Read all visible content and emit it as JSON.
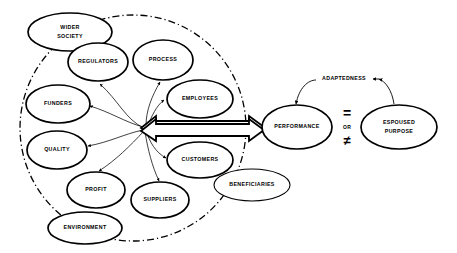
{
  "diagram": {
    "boundary": {
      "name": "organisational-boundary",
      "style": "dash-dot-circle"
    },
    "stakeholders": [
      {
        "id": "wider-society",
        "label": "WIDER\nSOCIETY",
        "line1": "WIDER",
        "line2": "SOCIETY",
        "cx": 70,
        "cy": 32,
        "rx": 42,
        "ry": 19,
        "inside_boundary": "straddles"
      },
      {
        "id": "regulators",
        "label": "REGULATORS",
        "line1": "REGULATORS",
        "line2": "",
        "cx": 98,
        "cy": 62,
        "rx": 30,
        "ry": 19,
        "inside_boundary": "yes"
      },
      {
        "id": "process",
        "label": "PROCESS",
        "line1": "PROCESS",
        "line2": "",
        "cx": 163,
        "cy": 60,
        "rx": 30,
        "ry": 20,
        "inside_boundary": "yes"
      },
      {
        "id": "employees",
        "label": "EMPLOYEES",
        "line1": "EMPLOYEES",
        "line2": "",
        "cx": 200,
        "cy": 99,
        "rx": 33,
        "ry": 19,
        "inside_boundary": "yes"
      },
      {
        "id": "funders",
        "label": "FUNDERS",
        "line1": "FUNDERS",
        "line2": "",
        "cx": 58,
        "cy": 104,
        "rx": 32,
        "ry": 19,
        "inside_boundary": "yes"
      },
      {
        "id": "quality",
        "label": "QUALITY",
        "line1": "QUALITY",
        "line2": "",
        "cx": 57,
        "cy": 150,
        "rx": 30,
        "ry": 19,
        "inside_boundary": "yes"
      },
      {
        "id": "customers",
        "label": "CUSTOMERS",
        "line1": "CUSTOMERS",
        "line2": "",
        "cx": 200,
        "cy": 160,
        "rx": 33,
        "ry": 18,
        "inside_boundary": "yes"
      },
      {
        "id": "profit",
        "label": "PROFIT",
        "line1": "PROFIT",
        "line2": "",
        "cx": 96,
        "cy": 190,
        "rx": 29,
        "ry": 18,
        "inside_boundary": "yes"
      },
      {
        "id": "suppliers",
        "label": "SUPPLIERS",
        "line1": "SUPPLIERS",
        "line2": "",
        "cx": 160,
        "cy": 200,
        "rx": 29,
        "ry": 18,
        "inside_boundary": "yes"
      },
      {
        "id": "environment",
        "label": "ENVIRONMENT",
        "line1": "ENVIRONMENT",
        "line2": "",
        "cx": 85,
        "cy": 228,
        "rx": 37,
        "ry": 16,
        "inside_boundary": "straddles"
      },
      {
        "id": "beneficiaries",
        "label": "BENEFICIARIES",
        "line1": "BENEFICIARIES",
        "line2": "",
        "cx": 252,
        "cy": 185,
        "rx": 38,
        "ry": 16,
        "inside_boundary": "no"
      }
    ],
    "outcome_nodes": [
      {
        "id": "performance",
        "label": "PERFORMANCE",
        "line1": "PERFORMANCE",
        "line2": "",
        "cx": 297,
        "cy": 127,
        "rx": 35,
        "ry": 22
      },
      {
        "id": "espoused-purpose",
        "label": "ESPOUSED PURPOSE",
        "line1": "ESPOUSED",
        "line2": "PURPOSE",
        "cx": 399,
        "cy": 127,
        "rx": 38,
        "ry": 22
      }
    ],
    "edge_labels": [
      {
        "id": "adaptedness",
        "text": "ADAPTEDNESS"
      }
    ],
    "operators": {
      "equals": "=",
      "or": "OR",
      "not_equals": "≠"
    },
    "connections": {
      "hub_to_performance": "double-headed-block-arrow",
      "hub_to_stakeholders": "radiating-thin-arrows",
      "performance_purpose": "adaptedness-double-arc-arrow"
    }
  }
}
